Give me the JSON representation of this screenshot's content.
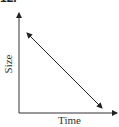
{
  "figure": {
    "label_fragment": "12.",
    "y_axis_label": "Size",
    "x_axis_label": "Time",
    "line_color": "#222222",
    "axis_color": "#333333"
  },
  "diagram": {
    "type": "axes-with-double-headed-line",
    "line": {
      "start": [
        26,
        32
      ],
      "end": [
        103,
        109
      ],
      "trend": "decreasing"
    }
  }
}
